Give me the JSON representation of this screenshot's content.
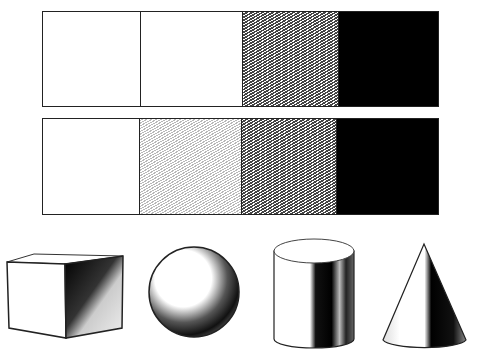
{
  "strips": [
    {
      "name": "tone-scale-3",
      "cells": [
        {
          "tone": "white",
          "width": 97
        },
        {
          "tone": "white",
          "width": 102
        },
        {
          "tone": "mid",
          "width": 96
        },
        {
          "tone": "black",
          "width": 102
        }
      ]
    },
    {
      "name": "tone-scale-4",
      "cells": [
        {
          "tone": "white",
          "width": 96
        },
        {
          "tone": "light",
          "width": 102
        },
        {
          "tone": "mid",
          "width": 95
        },
        {
          "tone": "black",
          "width": 104
        }
      ]
    }
  ],
  "shapes": [
    "cube",
    "sphere",
    "cylinder",
    "cone"
  ],
  "colors": {
    "ink": "#000000",
    "paper": "#ffffff",
    "line": "#222222"
  }
}
